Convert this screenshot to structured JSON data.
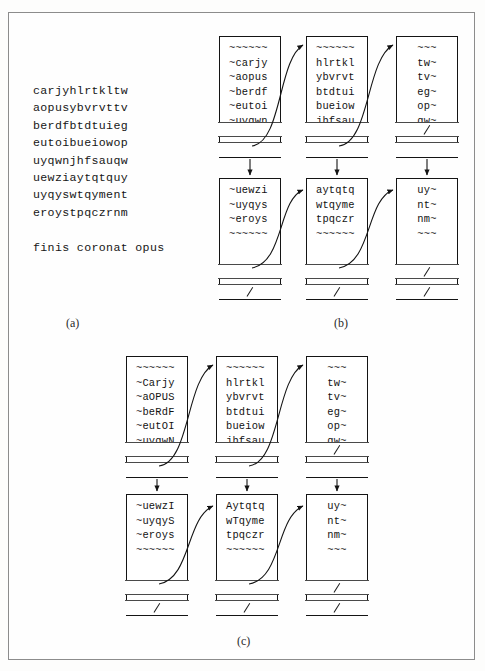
{
  "figure": {
    "caption_a": "(a)",
    "caption_b": "(b)",
    "caption_c": "(c)"
  },
  "panel_a": {
    "plaintext": "carjyhlrtkltw\naopusybvrvttv\nberdfbtdtuieg\neutoibueiowop\nuyqwnjhfsauqw\nuewziaytqtquy\nuyqyswtqyment\neroystpqczrnm\n\nfinis coronat opus"
  },
  "panel_b": {
    "nodes": [
      {
        "id": "b-r1c1",
        "align": "left",
        "text": "~~~~~~\n~carjy\n~aopus\n~berdf\n~eutoi\n~uyqwn",
        "cell1": "",
        "cell2": ""
      },
      {
        "id": "b-r1c2",
        "align": "left",
        "text": "~~~~~~\nhlrtkl\nybvrvt\nbtdtui\nbueiow\njhfsau",
        "cell1": "",
        "cell2": ""
      },
      {
        "id": "b-r1c3",
        "align": "center",
        "text": "~~~\ntw~\ntv~\neg~\nop~\nqw~",
        "cell1": "null-slash",
        "cell2": ""
      },
      {
        "id": "b-r2c1",
        "align": "left",
        "text": "~uewzi\n~uyqys\n~eroys\n~~~~~~",
        "cell1": "",
        "cell2": "null-slash"
      },
      {
        "id": "b-r2c2",
        "align": "left",
        "text": "aytqtq\nwtqyme\ntpqczr\n~~~~~~",
        "cell1": "",
        "cell2": "null-slash"
      },
      {
        "id": "b-r2c3",
        "align": "center",
        "text": "uy~\nnt~\nnm~\n~~~",
        "cell1": "null-slash",
        "cell2": "null-slash"
      }
    ]
  },
  "panel_c": {
    "nodes": [
      {
        "id": "c-r1c1",
        "align": "left",
        "text": "~~~~~~\n~Carjy\n~aOPUS\n~beRdF\n~eutOI\n~uyqwN",
        "cell1": "",
        "cell2": ""
      },
      {
        "id": "c-r1c2",
        "align": "left",
        "text": "~~~~~~\nhlrtkl\nybvrvt\nbtdtui\nbueiow\njhfsau",
        "cell1": "",
        "cell2": ""
      },
      {
        "id": "c-r1c3",
        "align": "center",
        "text": "~~~\ntw~\ntv~\neg~\nop~\nqw~",
        "cell1": "null-slash",
        "cell2": ""
      },
      {
        "id": "c-r2c1",
        "align": "left",
        "text": "~uewzI\n~uyqyS\n~eroys\n~~~~~~",
        "cell1": "",
        "cell2": "null-slash"
      },
      {
        "id": "c-r2c2",
        "align": "left",
        "text": "Aytqtq\nwTqyme\ntpqczr\n~~~~~~",
        "cell1": "",
        "cell2": "null-slash"
      },
      {
        "id": "c-r2c3",
        "align": "center",
        "text": "uy~\nnt~\nnm~\n~~~",
        "cell1": "null-slash",
        "cell2": "null-slash"
      }
    ]
  },
  "colors": {
    "ink": "#141414",
    "frame": "#8c8c8c",
    "paper": "#fefefe",
    "rule": "#4a4a4a"
  }
}
